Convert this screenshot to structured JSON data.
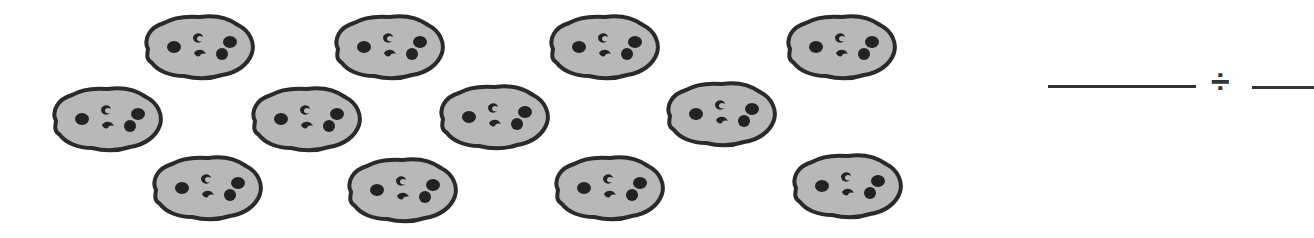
{
  "worksheet": {
    "cookie_count": 12,
    "colors": {
      "cookie_fill": "#b8b8b8",
      "cookie_outline": "#2a2a2a",
      "chip": "#222222"
    },
    "cookies": [
      {
        "row": 1,
        "x": 140,
        "y": 13
      },
      {
        "row": 1,
        "x": 330,
        "y": 13
      },
      {
        "row": 1,
        "x": 545,
        "y": 13
      },
      {
        "row": 1,
        "x": 782,
        "y": 13
      },
      {
        "row": 2,
        "x": 48,
        "y": 85
      },
      {
        "row": 2,
        "x": 247,
        "y": 85
      },
      {
        "row": 2,
        "x": 435,
        "y": 83
      },
      {
        "row": 2,
        "x": 662,
        "y": 80
      },
      {
        "row": 3,
        "x": 148,
        "y": 154
      },
      {
        "row": 3,
        "x": 343,
        "y": 156
      },
      {
        "row": 3,
        "x": 550,
        "y": 154
      },
      {
        "row": 3,
        "x": 788,
        "y": 152
      }
    ],
    "equation": {
      "dividend_blank": "",
      "operator": "÷",
      "divisor_blank": ""
    }
  }
}
